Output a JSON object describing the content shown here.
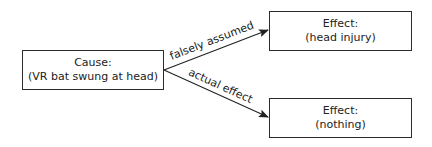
{
  "diagram": {
    "nodes": [
      {
        "id": "cause",
        "title": "Cause:",
        "detail": "(VR bat swung at head)"
      },
      {
        "id": "effect1",
        "title": "Effect:",
        "detail": "(head injury)"
      },
      {
        "id": "effect2",
        "title": "Effect:",
        "detail": "(nothing)"
      }
    ],
    "edges": [
      {
        "from": "cause",
        "to": "effect1",
        "label": "falsely assumed"
      },
      {
        "from": "cause",
        "to": "effect2",
        "label": "actual effect"
      }
    ],
    "colors": {
      "line": "#222222",
      "border": "#2b2b2b",
      "background": "#ffffff"
    }
  }
}
